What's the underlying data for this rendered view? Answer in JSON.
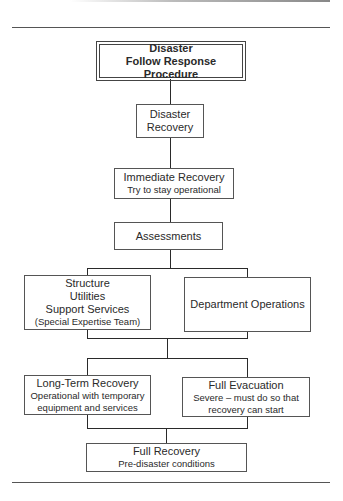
{
  "diagram": {
    "top": {
      "line1": "Disaster",
      "line2": "Follow Response Procedure"
    },
    "disaster_recovery": {
      "line1": "Disaster",
      "line2": "Recovery"
    },
    "immediate": {
      "title": "Immediate Recovery",
      "sub": "Try to stay operational"
    },
    "assessments": {
      "title": "Assessments"
    },
    "structure": {
      "line1": "Structure",
      "line2": "Utilities",
      "line3": "Support Services",
      "line4": "(Special Expertise Team)"
    },
    "department": {
      "title": "Department Operations"
    },
    "long_term": {
      "title": "Long-Term Recovery",
      "sub1": "Operational with temporary",
      "sub2": "equipment and services"
    },
    "evacuation": {
      "title": "Full Evacuation",
      "sub1": "Severe – must do so that",
      "sub2": "recovery can start"
    },
    "full_recovery": {
      "title": "Full Recovery",
      "sub": "Pre-disaster conditions"
    }
  }
}
